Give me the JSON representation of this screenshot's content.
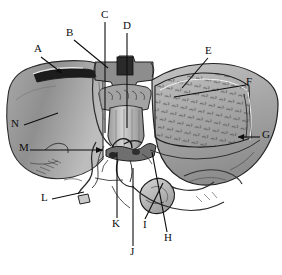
{
  "figure": {
    "background_color": "#ffffff",
    "ink_color": "#0d0d0d",
    "width": 282,
    "height": 275
  },
  "labels": [
    {
      "id": "A",
      "text": "A",
      "x": 34,
      "y": 48,
      "leader": "diagonal-down-right-arrow"
    },
    {
      "id": "B",
      "text": "B",
      "x": 66,
      "y": 32,
      "leader": "diagonal-down-right"
    },
    {
      "id": "C",
      "text": "C",
      "x": 101,
      "y": 13,
      "leader": "vertical-down"
    },
    {
      "id": "D",
      "text": "D",
      "x": 123,
      "y": 24,
      "leader": "vertical-down"
    },
    {
      "id": "E",
      "text": "E",
      "x": 205,
      "y": 49,
      "leader": "diagonal-down-left"
    },
    {
      "id": "F",
      "text": "F",
      "x": 246,
      "y": 80,
      "leader": "horizontal-left"
    },
    {
      "id": "G",
      "text": "G",
      "x": 262,
      "y": 133,
      "leader": "horizontal-left-arrow"
    },
    {
      "id": "H",
      "text": "H",
      "x": 164,
      "y": 236,
      "leader": "vertical-up"
    },
    {
      "id": "I",
      "text": "I",
      "x": 143,
      "y": 223,
      "leader": "diagonal-up-right"
    },
    {
      "id": "J",
      "text": "J",
      "x": 130,
      "y": 250,
      "leader": "vertical-up"
    },
    {
      "id": "K",
      "text": "K",
      "x": 113,
      "y": 222,
      "leader": "vertical-up"
    },
    {
      "id": "L",
      "text": "L",
      "x": 41,
      "y": 196,
      "leader": "diagonal-up-right"
    },
    {
      "id": "M",
      "text": "M",
      "x": 20,
      "y": 146,
      "leader": "horizontal-right-arrow"
    },
    {
      "id": "N",
      "text": "N",
      "x": 12,
      "y": 122,
      "leader": "diagonal-up-right"
    }
  ],
  "regions": {
    "left_lobe": "smooth gray gradient lobe on the left",
    "right_lobe": "large stippled and hatched lobe on the right",
    "central_structures": "vertebral body and hilar vessel complex in the center",
    "gallbladder": "rounded sac at lower center-right"
  }
}
